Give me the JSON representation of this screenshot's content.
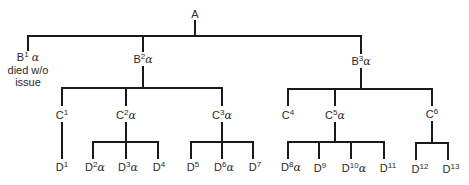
{
  "diagram": {
    "type": "family-tree",
    "line_color": "#1a1a1a",
    "text_color": "#2a2a2a",
    "root": {
      "id": "A",
      "letter": "A",
      "sup": "",
      "alpha": ""
    },
    "nodes": {
      "B1": {
        "letter": "B",
        "sup": "1",
        "alpha": "α",
        "note1": "died w/o",
        "note2": "issue"
      },
      "B2": {
        "letter": "B",
        "sup": "2",
        "alpha": "α"
      },
      "B3": {
        "letter": "B",
        "sup": "3",
        "alpha": "α"
      },
      "C1": {
        "letter": "C",
        "sup": "1",
        "alpha": ""
      },
      "C2": {
        "letter": "C",
        "sup": "2",
        "alpha": "α"
      },
      "C3": {
        "letter": "C",
        "sup": "3",
        "alpha": "α"
      },
      "C4": {
        "letter": "C",
        "sup": "4",
        "alpha": ""
      },
      "C5": {
        "letter": "C",
        "sup": "5",
        "alpha": "α"
      },
      "C6": {
        "letter": "C",
        "sup": "6",
        "alpha": ""
      },
      "D1": {
        "letter": "D",
        "sup": "1",
        "alpha": ""
      },
      "D2": {
        "letter": "D",
        "sup": "2",
        "alpha": "α"
      },
      "D3": {
        "letter": "D",
        "sup": "3",
        "alpha": "α"
      },
      "D4": {
        "letter": "D",
        "sup": "4",
        "alpha": ""
      },
      "D5": {
        "letter": "D",
        "sup": "5",
        "alpha": ""
      },
      "D6": {
        "letter": "D",
        "sup": "6",
        "alpha": "α"
      },
      "D7": {
        "letter": "D",
        "sup": "7",
        "alpha": ""
      },
      "D8": {
        "letter": "D",
        "sup": "8",
        "alpha": "α"
      },
      "D9": {
        "letter": "D",
        "sup": "9",
        "alpha": ""
      },
      "D10": {
        "letter": "D",
        "sup": "10",
        "alpha": "α"
      },
      "D11": {
        "letter": "D",
        "sup": "11",
        "alpha": ""
      },
      "D12": {
        "letter": "D",
        "sup": "12",
        "alpha": ""
      },
      "D13": {
        "letter": "D",
        "sup": "13",
        "alpha": ""
      }
    },
    "edges": [
      [
        "A",
        "B1"
      ],
      [
        "A",
        "B2"
      ],
      [
        "A",
        "B3"
      ],
      [
        "B2",
        "C1"
      ],
      [
        "B2",
        "C2"
      ],
      [
        "B2",
        "C3"
      ],
      [
        "B3",
        "C4"
      ],
      [
        "B3",
        "C5"
      ],
      [
        "B3",
        "C6"
      ],
      [
        "C1",
        "D1"
      ],
      [
        "C2",
        "D2"
      ],
      [
        "C2",
        "D3"
      ],
      [
        "C2",
        "D4"
      ],
      [
        "C3",
        "D5"
      ],
      [
        "C3",
        "D6"
      ],
      [
        "C3",
        "D7"
      ],
      [
        "C5",
        "D8"
      ],
      [
        "C5",
        "D9"
      ],
      [
        "C5",
        "D10"
      ],
      [
        "C5",
        "D11"
      ],
      [
        "C6",
        "D12"
      ],
      [
        "C6",
        "D13"
      ]
    ]
  }
}
